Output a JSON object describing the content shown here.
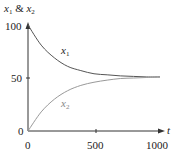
{
  "chart_data": {
    "type": "line",
    "title": "",
    "xlabel": "t",
    "ylabel": "x1 & x2",
    "xlim": [
      0,
      1000
    ],
    "ylim": [
      0,
      100
    ],
    "x_ticks": [
      "0",
      "500",
      "1000"
    ],
    "y_ticks": [
      "0",
      "50",
      "100"
    ],
    "grid": false,
    "legend": "inline labels",
    "x": [
      0,
      100,
      200,
      300,
      400,
      500,
      600,
      700,
      800,
      900,
      1000
    ],
    "series": [
      {
        "name": "x1",
        "color": "#555555",
        "values": [
          100,
          81,
          69,
          61,
          57,
          54,
          53,
          52,
          51.5,
          51,
          51
        ]
      },
      {
        "name": "x2",
        "color": "#999999",
        "values": [
          0,
          18,
          30,
          38,
          43,
          46,
          48,
          49.5,
          50,
          50.5,
          51
        ]
      }
    ]
  },
  "labels": {
    "y_axis_main": "x",
    "y_axis_sub1": "1",
    "y_axis_amp": " & ",
    "y_axis_main2": "x",
    "y_axis_sub2": "2",
    "x_axis": "t",
    "series1_main": "x",
    "series1_sub": "1",
    "series2_main": "x",
    "series2_sub": "2",
    "tick_y_100": "100",
    "tick_y_50": "50",
    "tick_y_0": "0",
    "tick_x_0": "0",
    "tick_x_500": "500",
    "tick_x_1000": "1000"
  }
}
